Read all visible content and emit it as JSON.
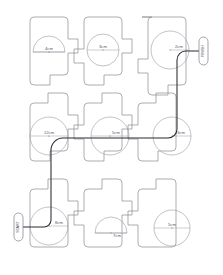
{
  "worksheet": {
    "title": "Circle Dimension Tile Puzzle",
    "grid": {
      "rows": 3,
      "cols": 3
    },
    "colors": {
      "tile_stroke": "#8b8b93",
      "shape_stroke": "#9a9aa2",
      "route_stroke": "#2b2b33",
      "label_text": "#55555d",
      "background": "#ffffff"
    }
  },
  "tiles": [
    {
      "id": "r1c1",
      "row": 1,
      "col": 1,
      "shape": "semicircle",
      "measure": "diameter",
      "label": "4cm"
    },
    {
      "id": "r1c2",
      "row": 1,
      "col": 2,
      "shape": "circle",
      "measure": "diameter",
      "label": "3cm"
    },
    {
      "id": "r1c3",
      "row": 1,
      "col": 3,
      "shape": "circle",
      "measure": "radius",
      "label": "2cm"
    },
    {
      "id": "r2c1",
      "row": 2,
      "col": 1,
      "shape": "circle",
      "measure": "diameter",
      "label": "12cm"
    },
    {
      "id": "r2c2",
      "row": 2,
      "col": 2,
      "shape": "circle",
      "measure": "diameter",
      "label": "5cm"
    },
    {
      "id": "r2c3",
      "row": 2,
      "col": 3,
      "shape": "circle",
      "measure": "radius",
      "label": "3cm"
    },
    {
      "id": "r3c1",
      "row": 3,
      "col": 1,
      "shape": "circle",
      "measure": "radius",
      "label": "8cm"
    },
    {
      "id": "r3c2",
      "row": 3,
      "col": 2,
      "shape": "semicircle",
      "measure": "diameter",
      "label": "7cm"
    },
    {
      "id": "r3c3",
      "row": 3,
      "col": 3,
      "shape": "circle",
      "measure": "diameter",
      "label": "5cm"
    }
  ],
  "endpoints": {
    "start": {
      "position": "left-bottom",
      "label": "START"
    },
    "finish": {
      "position": "right-top",
      "label": "FINISH"
    }
  },
  "route": {
    "description": "Traced path connecting start to finish through circle centres",
    "waypoints": [
      "r3c1",
      "r2c1",
      "r2c2",
      "r2c3",
      "r1c3"
    ]
  }
}
